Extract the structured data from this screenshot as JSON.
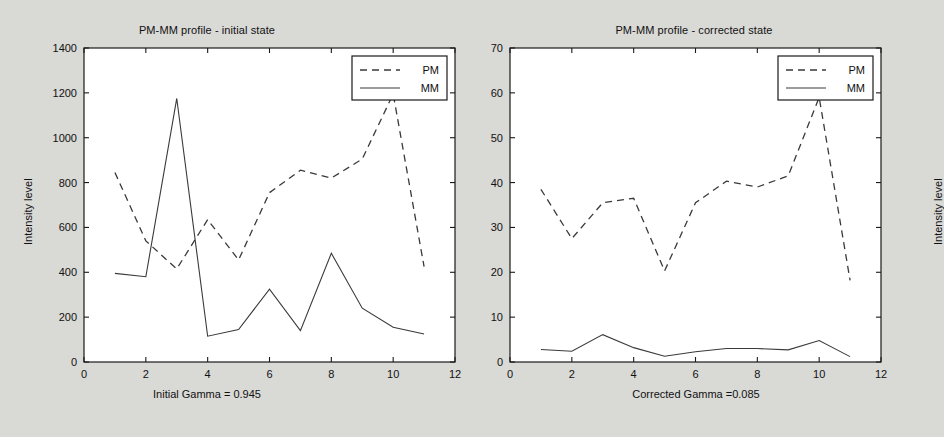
{
  "figure": {
    "background": "#d9d9d6",
    "plot_background": "#ffffff",
    "line_color": "#3a3a3a"
  },
  "panels": [
    {
      "id": "initial",
      "title": "PM-MM profile - initial state",
      "caption": "Initial Gamma = 0.945",
      "ylabel": "Intensity level",
      "legend": {
        "pm": "PM",
        "mm": "MM"
      }
    },
    {
      "id": "corrected",
      "title": "PM-MM profile - corrected state",
      "caption": "Corrected Gamma =0.085",
      "ylabel": "Intensity level",
      "legend": {
        "pm": "PM",
        "mm": "MM"
      }
    }
  ],
  "chart_data": [
    {
      "type": "line",
      "title": "PM-MM profile - initial state",
      "xlabel": "Initial Gamma = 0.945",
      "ylabel": "Intensity level",
      "xlim": [
        0,
        12
      ],
      "ylim": [
        0,
        1400
      ],
      "xticks": [
        0,
        2,
        4,
        6,
        8,
        10,
        12
      ],
      "yticks": [
        0,
        200,
        400,
        600,
        800,
        1000,
        1200,
        1400
      ],
      "grid": false,
      "legend_position": "upper right",
      "x": [
        1,
        2,
        3,
        4,
        5,
        6,
        7,
        8,
        9,
        10,
        11
      ],
      "series": [
        {
          "name": "PM",
          "style": "dashed",
          "values": [
            845,
            540,
            415,
            635,
            455,
            755,
            855,
            820,
            905,
            1195,
            425
          ]
        },
        {
          "name": "MM",
          "style": "solid",
          "values": [
            395,
            380,
            1175,
            115,
            145,
            325,
            140,
            485,
            240,
            155,
            125
          ]
        }
      ]
    },
    {
      "type": "line",
      "title": "PM-MM profile - corrected state",
      "xlabel": "Corrected Gamma =0.085",
      "ylabel": "Intensity level",
      "xlim": [
        0,
        12
      ],
      "ylim": [
        0,
        70
      ],
      "xticks": [
        0,
        2,
        4,
        6,
        8,
        10,
        12
      ],
      "yticks": [
        0,
        10,
        20,
        30,
        40,
        50,
        60,
        70
      ],
      "grid": false,
      "legend_position": "upper right",
      "x": [
        1,
        2,
        3,
        4,
        5,
        6,
        7,
        8,
        9,
        10,
        11
      ],
      "series": [
        {
          "name": "PM",
          "style": "dashed",
          "values": [
            38.5,
            27.5,
            35.5,
            36.5,
            20.3,
            35.5,
            40.3,
            39.0,
            41.5,
            59.0,
            18.2
          ]
        },
        {
          "name": "MM",
          "style": "solid",
          "values": [
            2.8,
            2.4,
            6.1,
            3.2,
            1.3,
            2.3,
            3.0,
            3.0,
            2.7,
            4.8,
            1.2
          ]
        }
      ]
    }
  ]
}
